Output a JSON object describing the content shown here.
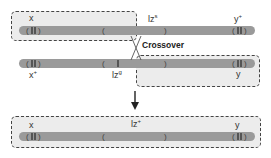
{
  "diagram": {
    "top_chromosome": {
      "labels": {
        "left": "x",
        "mid_base": "lz",
        "mid_sup": "s",
        "right_base": "y",
        "right_sup": "+"
      }
    },
    "bottom_chromosome": {
      "labels": {
        "left_base": "x",
        "left_sup": "+",
        "mid_base": "lz",
        "mid_sup": "g",
        "right": "y"
      }
    },
    "crossover_label": "Crossover",
    "result_chromosome": {
      "labels": {
        "left": "x",
        "mid_base": "lz",
        "mid_sup": "+",
        "right": "y"
      }
    },
    "colors": {
      "chromosome": "#9a9a9a",
      "box_fill": "#ececec",
      "box_border": "#444444"
    }
  }
}
